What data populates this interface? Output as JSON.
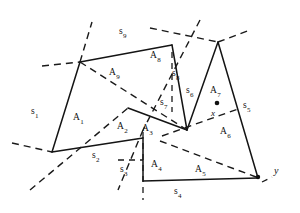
{
  "figure": {
    "background_color": "#ffffff",
    "stroke_color": "#141414",
    "dash_color": "#1a1a1a",
    "width": 300,
    "height": 213
  },
  "labels": {
    "s1": {
      "base": "s",
      "sub": "1"
    },
    "s2": {
      "base": "s",
      "sub": "2"
    },
    "s3": {
      "base": "s",
      "sub": "3"
    },
    "s4": {
      "base": "s",
      "sub": "4"
    },
    "s5": {
      "base": "s",
      "sub": "5"
    },
    "s6": {
      "base": "s",
      "sub": "6"
    },
    "s7": {
      "base": "s",
      "sub": "7"
    },
    "s8": {
      "base": "s",
      "sub": "8"
    },
    "s9": {
      "base": "s",
      "sub": "9"
    },
    "a1": {
      "base": "A",
      "sub": "1"
    },
    "a2": {
      "base": "A",
      "sub": "2"
    },
    "a3": {
      "base": "A",
      "sub": "3"
    },
    "a4": {
      "base": "A",
      "sub": "4"
    },
    "a5": {
      "base": "A",
      "sub": "5"
    },
    "a6": {
      "base": "A",
      "sub": "6"
    },
    "a7": {
      "base": "A",
      "sub": "7"
    },
    "a8": {
      "base": "A",
      "sub": "8"
    },
    "a9": {
      "base": "A",
      "sub": "9"
    },
    "x": "x",
    "y": "y"
  },
  "geometry": {
    "outline_points": "80,62 172,45 218,42 258,178 143,181 143,138 52,152",
    "solid_segments": [
      {
        "name": "s9-top-edge",
        "d": "M 80,62 L 172,45"
      },
      {
        "name": "s8-edge",
        "d": "M 172,45 L 187,130"
      },
      {
        "name": "s6-edge",
        "d": "M 187,130 L 218,42"
      },
      {
        "name": "s5-edge",
        "d": "M 218,42 L 258,178"
      },
      {
        "name": "s4-edge",
        "d": "M 258,178 L 143,181"
      },
      {
        "name": "s3-edge",
        "d": "M 143,181 L 143,138"
      },
      {
        "name": "s2-edge",
        "d": "M 143,138 L 52,152"
      },
      {
        "name": "s1-edge",
        "d": "M 52,152 L 80,62"
      },
      {
        "name": "s7-edge",
        "d": "M 128,108 L 187,130"
      }
    ],
    "dashed_segments": [
      {
        "name": "dash-a9-diagonal",
        "d": "M 80,62 L 187,130"
      },
      {
        "name": "dash-upper-left-through",
        "d": "M 42,66 L 80,62 L 92,22"
      },
      {
        "name": "dash-a1-a2-cut",
        "d": "M 30,190 L 128,108"
      },
      {
        "name": "dash-left-low",
        "d": "M 12,143 L 52,152"
      },
      {
        "name": "dash-s3-low",
        "d": "M 118,160 L 143,160"
      },
      {
        "name": "dash-s3-vertical",
        "d": "M 143,130 L 143,200"
      },
      {
        "name": "dash-a4-a5-cut",
        "d": "M 200,20 L 143,130 L 118,190"
      },
      {
        "name": "dash-a8-vertical",
        "d": "M 172,52 L 172,110"
      },
      {
        "name": "dash-top-cross",
        "d": "M 150,30 L 218,42 L 250,34"
      },
      {
        "name": "dash-x-line",
        "d": "M 160,135 L 187,130 L 238,109"
      },
      {
        "name": "dash-a6-cut",
        "d": "M 160,140 L 258,178"
      },
      {
        "name": "dash-y-mark",
        "d": "M 262,182 L 274,176"
      }
    ],
    "dots": [
      {
        "name": "a7-centroid-dot",
        "cx": 217,
        "cy": 103,
        "r": 2.3
      },
      {
        "name": "y-vertex-dot",
        "cx": 258,
        "cy": 177,
        "r": 2.2
      }
    ]
  },
  "label_positions": {
    "s1": {
      "x": 31,
      "y": 112
    },
    "s2": {
      "x": 92,
      "y": 155
    },
    "s3": {
      "x": 122,
      "y": 170
    },
    "s4": {
      "x": 174,
      "y": 190
    },
    "s5": {
      "x": 243,
      "y": 105
    },
    "s6": {
      "x": 187,
      "y": 90
    },
    "s7": {
      "x": 160,
      "y": 102
    },
    "s8": {
      "x": 172,
      "y": 73
    },
    "s9": {
      "x": 119,
      "y": 31
    },
    "a1": {
      "x": 74,
      "y": 117
    },
    "a2": {
      "x": 119,
      "y": 126
    },
    "a3": {
      "x": 143,
      "y": 128
    },
    "a4": {
      "x": 152,
      "y": 164
    },
    "a5": {
      "x": 195,
      "y": 169
    },
    "a6": {
      "x": 221,
      "y": 131
    },
    "a7": {
      "x": 211,
      "y": 90
    },
    "a8": {
      "x": 151,
      "y": 55
    },
    "a9": {
      "x": 110,
      "y": 72
    },
    "x": {
      "x": 211,
      "y": 113
    },
    "y": {
      "x": 274,
      "y": 170
    }
  }
}
